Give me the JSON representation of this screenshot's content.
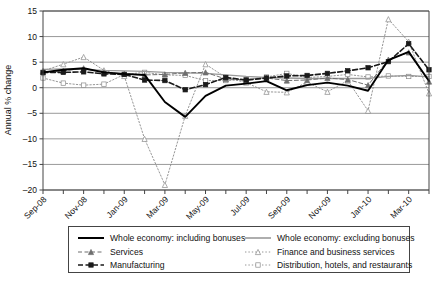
{
  "chart_data": {
    "type": "line",
    "title": "",
    "xlabel": "",
    "ylabel": "Annual % change",
    "ylim": [
      -20,
      15
    ],
    "ytick_step": 5,
    "ytick_labels": [
      "15",
      "10",
      "5",
      "0",
      "-5",
      "-10",
      "-15",
      "-20"
    ],
    "ytick_values": [
      15,
      10,
      5,
      0,
      -5,
      -10,
      -15,
      -20
    ],
    "grid": "horizontal",
    "legend_position": "below-plot",
    "x": [
      "Sep-08",
      "Oct-08",
      "Nov-08",
      "Dec-08",
      "Jan-09",
      "Feb-09",
      "Mar-09",
      "Apr-09",
      "May-09",
      "Jun-09",
      "Jul-09",
      "Aug-09",
      "Sep-09",
      "Oct-09",
      "Nov-09",
      "Dec-09",
      "Jan-10",
      "Feb-10",
      "Mar-10",
      "Apr-10"
    ],
    "xtick_labels": [
      "Sep-08",
      "Nov-08",
      "Jan-09",
      "Mar-09",
      "May-09",
      "Jul-09",
      "Sep-09",
      "Nov-09",
      "Jan-10",
      "Mar-10"
    ],
    "xtick_label_indices": [
      0,
      2,
      4,
      6,
      8,
      10,
      12,
      14,
      16,
      18
    ],
    "series": [
      {
        "name": "Whole economy: including bonuses",
        "style": "solid-thick-black",
        "color": "#000000",
        "marker": "none",
        "values": [
          3.0,
          3.5,
          3.8,
          3.0,
          2.7,
          2.5,
          -2.8,
          -5.7,
          -1.6,
          0.4,
          0.8,
          1.3,
          -0.5,
          0.5,
          1.0,
          0.4,
          -0.6,
          5.4,
          7.0,
          1.3
        ]
      },
      {
        "name": "Whole economy: excluding bonuses",
        "style": "solid-gray",
        "color": "#9a9a9a",
        "marker": "none",
        "values": [
          3.6,
          3.7,
          3.6,
          3.4,
          3.3,
          3.2,
          3.0,
          2.9,
          2.8,
          2.5,
          2.2,
          2.0,
          1.9,
          1.8,
          1.8,
          1.8,
          1.8,
          2.2,
          2.4,
          2.1
        ]
      },
      {
        "name": "Services",
        "style": "dashed-gray",
        "color": "#6f6f6f",
        "marker": "triangle",
        "values": [
          3.0,
          3.3,
          3.8,
          3.0,
          2.7,
          2.5,
          2.6,
          2.9,
          3.0,
          1.7,
          1.5,
          1.9,
          1.4,
          1.5,
          1.9,
          1.6,
          0.5,
          5.5,
          6.9,
          1.2
        ]
      },
      {
        "name": "Finance and business services",
        "style": "dotted-gray",
        "color": "#8a8a8a",
        "marker": "triangle-open",
        "values": [
          3.3,
          4.6,
          6.0,
          3.4,
          2.3,
          -10.0,
          -19.0,
          -5.5,
          4.6,
          2.0,
          1.0,
          -0.8,
          -0.9,
          1.1,
          -0.8,
          1.4,
          -4.5,
          13.4,
          9.0,
          -1.1
        ]
      },
      {
        "name": "Manufacturing",
        "style": "dashed-thick-black",
        "color": "#1a1a1a",
        "marker": "square",
        "values": [
          3.0,
          3.0,
          3.1,
          2.7,
          2.6,
          1.5,
          1.4,
          -0.4,
          0.6,
          2.0,
          1.5,
          1.9,
          2.3,
          2.4,
          2.8,
          3.3,
          3.9,
          5.1,
          8.6,
          3.5
        ]
      },
      {
        "name": "Distribution, hotels, and restaurants",
        "style": "dotted-gray",
        "color": "#8a8a8a",
        "marker": "square-open",
        "values": [
          1.9,
          0.9,
          0.5,
          0.7,
          2.6,
          3.0,
          2.5,
          2.4,
          1.4,
          1.4,
          1.6,
          2.1,
          2.8,
          2.0,
          2.2,
          2.6,
          2.1,
          2.3,
          2.2,
          2.2
        ]
      }
    ]
  },
  "legend": {
    "items": [
      {
        "label": "Whole economy: including bonuses",
        "key": "solid-thick-black"
      },
      {
        "label": "Whole economy: excluding bonuses",
        "key": "solid-gray"
      },
      {
        "label": "Services",
        "key": "dashed-gray"
      },
      {
        "label": "Finance and business services",
        "key": "dotted-gray-tri"
      },
      {
        "label": "Manufacturing",
        "key": "dashed-thick-black"
      },
      {
        "label": "Distribution, hotels, and restaurants",
        "key": "dotted-gray-sq"
      }
    ]
  },
  "axis": {
    "ylabel": "Annual % change"
  },
  "colors": {
    "axis": "#444444",
    "grid": "#7f7f7f",
    "black": "#000000",
    "gray": "#9a9a9a"
  }
}
